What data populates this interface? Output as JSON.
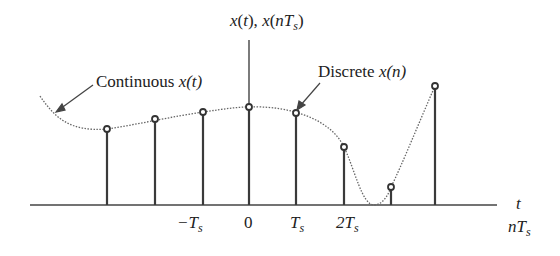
{
  "diagram": {
    "y_axis_label": {
      "prefix": "x",
      "t": "t",
      "sep": "), ",
      "x2": "x",
      "n": "n",
      "T": "T",
      "s": "s"
    },
    "annotations": {
      "continuous": {
        "word": "Continuous ",
        "expr": "x(t)"
      },
      "discrete": {
        "word": "Discrete ",
        "expr": "x(n)"
      }
    },
    "x_axis": {
      "label_t": "t",
      "label_nTs": {
        "n": "nT",
        "s": "s"
      },
      "ticks": [
        {
          "main": "−T",
          "sub": "s"
        },
        {
          "main": "0",
          "sub": ""
        },
        {
          "main": "T",
          "sub": "s"
        },
        {
          "main": "2T",
          "sub": "s"
        }
      ]
    },
    "samples": [
      {
        "x": 107,
        "y": 129
      },
      {
        "x": 155,
        "y": 119
      },
      {
        "x": 203,
        "y": 112
      },
      {
        "x": 249,
        "y": 107
      },
      {
        "x": 296,
        "y": 113
      },
      {
        "x": 344,
        "y": 147
      },
      {
        "x": 391,
        "y": 187
      },
      {
        "x": 435,
        "y": 86
      }
    ],
    "colors": {
      "stem": "#3a3a3a",
      "curve": "#666666",
      "axis": "#444444"
    }
  }
}
